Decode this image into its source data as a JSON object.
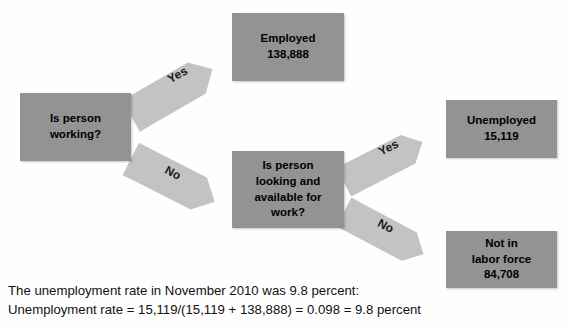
{
  "diagram": {
    "colors": {
      "box_fill": "#939393",
      "arrow_fill": "#c3c3c3",
      "text": "#000000",
      "background": "#ffffff"
    },
    "nodes": [
      {
        "id": "working",
        "label": "Is person\nworking?",
        "name": "is-person-working-box"
      },
      {
        "id": "employed",
        "label": "Employed\n138,888",
        "name": "employed-box"
      },
      {
        "id": "looking",
        "label": "Is person\nlooking and\navailable for\nwork?",
        "name": "is-person-looking-box"
      },
      {
        "id": "unemployed",
        "label": "Unemployed\n15,119",
        "name": "unemployed-box"
      },
      {
        "id": "nilf",
        "label": "Not in\nlabor force\n84,708",
        "name": "not-in-labor-force-box"
      }
    ],
    "arrows": [
      {
        "id": "yes1",
        "label": "Yes",
        "from": "working",
        "to": "employed",
        "direction": "up-right"
      },
      {
        "id": "no1",
        "label": "No",
        "from": "working",
        "to": "looking",
        "direction": "down-right"
      },
      {
        "id": "yes2",
        "label": "Yes",
        "from": "looking",
        "to": "unemployed",
        "direction": "up-right"
      },
      {
        "id": "no2",
        "label": "No",
        "from": "looking",
        "to": "nilf",
        "direction": "down-right"
      }
    ]
  },
  "caption": {
    "line1": "The unemployment rate in November 2010 was 9.8 percent:",
    "line2": "Unemployment rate = 15,119/(15,119 + 138,888) = 0.098 = 9.8 percent"
  }
}
